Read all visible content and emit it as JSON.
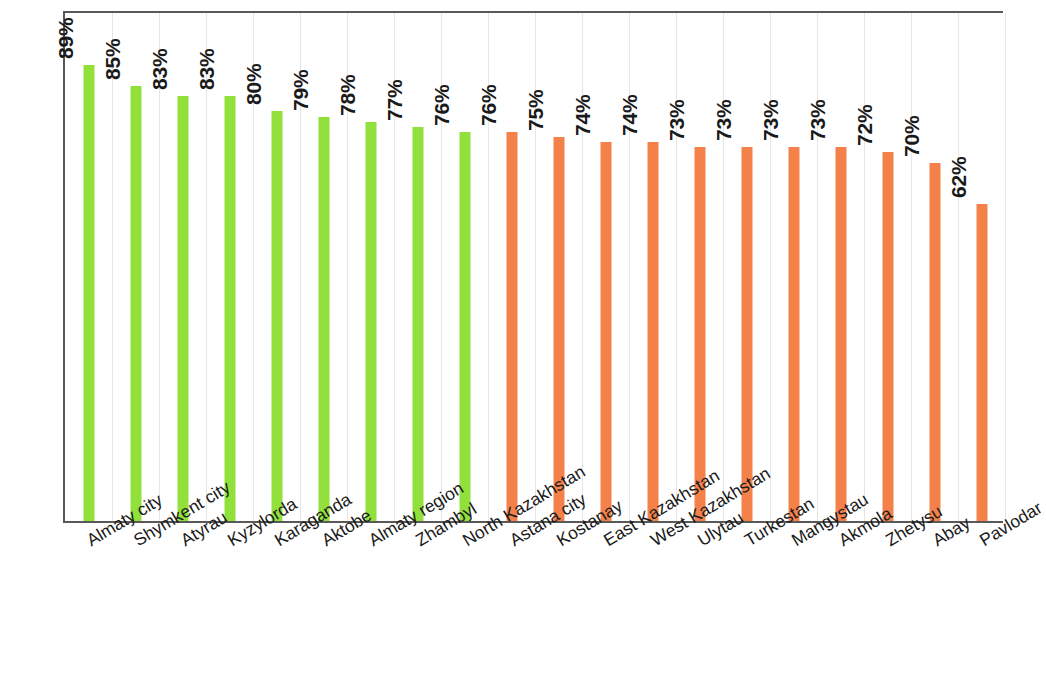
{
  "chart_data": {
    "type": "bar",
    "title": "",
    "subtitle": "",
    "xlabel": "",
    "ylabel": "",
    "ylim": [
      0,
      100
    ],
    "grid": "vertical-category-gridlines",
    "legend": "none",
    "value_label_suffix": "%",
    "value_label_rotation": "-90",
    "category_label_rotation": "-31",
    "colors": {
      "green": "#92e03c",
      "orange": "#f4814a",
      "axis": "#595959",
      "gridline": "#e6e6e6",
      "text": "#1a1a1a"
    },
    "categories": [
      "Almaty city",
      "Shymkent city",
      "Atyrau",
      "Kyzylorda",
      "Karaganda",
      "Aktobe",
      "Almaty region",
      "Zhambyl",
      "North Kazakhstan",
      "Astana city",
      "Kostanay",
      "East Kazakhstan",
      "West Kazakhstan",
      "Ulytau",
      "Turkestan",
      "Mangystau",
      "Akmola",
      "Zhetysu",
      "Abay",
      "Pavlodar"
    ],
    "values": [
      89,
      85,
      83,
      83,
      80,
      79,
      78,
      77,
      76,
      76,
      75,
      74,
      74,
      73,
      73,
      73,
      73,
      72,
      70,
      62
    ],
    "value_labels": [
      "89%",
      "85%",
      "83%",
      "83%",
      "80%",
      "79%",
      "78%",
      "77%",
      "76%",
      "76%",
      "75%",
      "74%",
      "74%",
      "73%",
      "73%",
      "73%",
      "73%",
      "72%",
      "70%",
      "62%"
    ],
    "bar_colors": [
      "green",
      "green",
      "green",
      "green",
      "green",
      "green",
      "green",
      "green",
      "green",
      "orange",
      "orange",
      "orange",
      "orange",
      "orange",
      "orange",
      "orange",
      "orange",
      "orange",
      "orange",
      "orange"
    ]
  }
}
